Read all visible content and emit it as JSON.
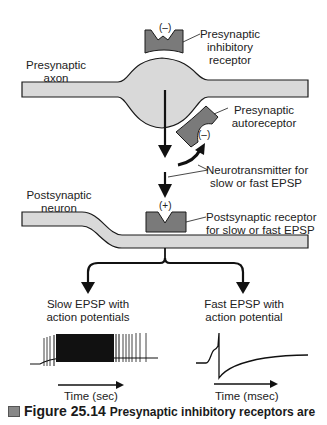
{
  "labels": {
    "presynaptic_axon": [
      "Presynaptic",
      "axon"
    ],
    "inhibitory_receptor": [
      "Presynaptic",
      "inhibitory",
      "receptor"
    ],
    "autoreceptor": [
      "Presynaptic",
      "autoreceptor"
    ],
    "neurotransmitter": [
      "Neurotransmitter for",
      "slow or fast EPSP"
    ],
    "postsynaptic_neuron": [
      "Postsynaptic",
      "neuron"
    ],
    "postsynaptic_receptor": [
      "Postsynaptic receptor",
      "for slow or fast EPSP"
    ],
    "slow_epsp": [
      "Slow EPSP with",
      "action potentials"
    ],
    "fast_epsp": [
      "Fast EPSP with",
      "action potential"
    ],
    "time_sec": "Time (sec)",
    "time_msec": "Time (msec)"
  },
  "signs": {
    "inhibitory": "(–)",
    "autoreceptor": "(–)",
    "postsynaptic": "(+)"
  },
  "caption": {
    "figure": "Figure 25.14",
    "text": "Presynaptic inhibitory receptors are"
  },
  "colors": {
    "membrane_fill": "#d9d9d9",
    "receptor_fill": "#7a7a7a",
    "stroke": "#1a1a1a"
  }
}
